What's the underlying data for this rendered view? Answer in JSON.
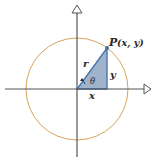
{
  "diagram": {
    "type": "unit-circle-triangle",
    "colors": {
      "axis": "#555555",
      "circle": "#d9a45a",
      "triangle_fill": "#9fb3cc",
      "triangle_stroke": "#3f6ea8",
      "point": "#3f6ea8",
      "text": "#2a2a2a"
    },
    "labels": {
      "point_P": "P",
      "point_coords": "(x, y)",
      "hypotenuse": "r",
      "vertical_leg": "y",
      "horizontal_leg": "x",
      "angle": "θ"
    }
  }
}
